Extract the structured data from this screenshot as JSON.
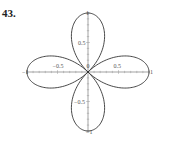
{
  "problem_number": "43.",
  "chart_data": {
    "type": "line",
    "title": "",
    "equation_hint": "r = cos(2θ)",
    "xlabel": "",
    "ylabel": "",
    "xlim": [
      -1,
      1
    ],
    "ylim": [
      -1,
      1
    ],
    "grid": false,
    "legend": null,
    "x_tick_labels": [
      {
        "value": -1,
        "label": "−1"
      },
      {
        "value": -0.5,
        "label": "−0.5"
      },
      {
        "value": 0,
        "label": "0"
      },
      {
        "value": 0.5,
        "label": "0.5"
      },
      {
        "value": 1,
        "label": "1"
      }
    ],
    "y_tick_labels": [
      {
        "value": 1,
        "label": "1"
      },
      {
        "value": 0.5,
        "label": "0.5"
      },
      {
        "value": -0.5,
        "label": "−0.5"
      },
      {
        "value": -1,
        "label": "−1"
      }
    ],
    "petals": [
      {
        "direction": "right",
        "tip": [
          1,
          0
        ]
      },
      {
        "direction": "up",
        "tip": [
          0,
          1
        ]
      },
      {
        "direction": "left",
        "tip": [
          -1,
          0
        ]
      },
      {
        "direction": "down",
        "tip": [
          0,
          -1
        ]
      }
    ],
    "series": [
      {
        "name": "rose",
        "color": "#333333",
        "samples": 400
      }
    ]
  }
}
